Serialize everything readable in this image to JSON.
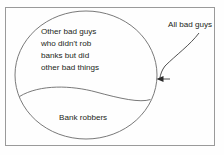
{
  "diagram": {
    "type": "venn-euler",
    "title_visible": false,
    "background_color": "#fefefe",
    "border_color": "#9a9a9a",
    "stroke_color": "#5f5f5f",
    "text_color": "#231f20",
    "outer_frame": {
      "name": "diagram-frame",
      "x": 5,
      "y": 7,
      "width": 210,
      "height": 139
    },
    "sets": [
      {
        "name": "outer-set",
        "label_lines": [
          "Other bad guys",
          "who didn't rob",
          "banks but did",
          "other bad things"
        ],
        "shape": "ellipse",
        "center_x": 86,
        "center_y": 75,
        "radius_x": 71,
        "radius_y": 64
      },
      {
        "name": "inner-set",
        "label_lines": [
          "Bank robbers"
        ],
        "shape": "lens-segment",
        "note": "lower circular segment of the outer ellipse, chord arc from left edge to right edge"
      }
    ],
    "callout": {
      "name": "all-bad-guys-callout",
      "label": "All bad guys",
      "label_x": 168,
      "label_y": 27,
      "arrow_from_x": 198,
      "arrow_from_y": 33,
      "arrow_to_x": 159,
      "arrow_to_y": 79,
      "arrow_head": "left"
    },
    "labels": {
      "outer_line_1": "Other bad guys",
      "outer_line_2": "who didn't rob",
      "outer_line_3": "banks but did",
      "outer_line_4": "other bad things",
      "inner_line_1": "Bank robbers",
      "callout_label": "All bad guys"
    }
  }
}
